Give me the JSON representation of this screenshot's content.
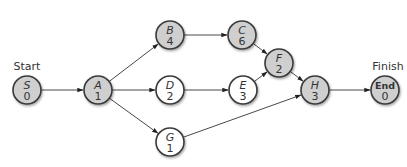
{
  "diagram": {
    "type": "activity-on-node network",
    "labels": {
      "start": "Start",
      "finish": "Finish"
    },
    "colors": {
      "critical_fill": "#cfcfcf",
      "normal_fill": "#ffffff",
      "stroke": "#3a3a3a"
    },
    "nodes": [
      {
        "id": "S",
        "name": "S",
        "duration": "0",
        "x": 27,
        "y": 90,
        "critical": true
      },
      {
        "id": "A",
        "name": "A",
        "duration": "1",
        "x": 98,
        "y": 90,
        "critical": true
      },
      {
        "id": "B",
        "name": "B",
        "duration": "4",
        "x": 170,
        "y": 35,
        "critical": true
      },
      {
        "id": "C",
        "name": "C",
        "duration": "6",
        "x": 242,
        "y": 35,
        "critical": true
      },
      {
        "id": "D",
        "name": "D",
        "duration": "2",
        "x": 170,
        "y": 90,
        "critical": false
      },
      {
        "id": "E",
        "name": "E",
        "duration": "3",
        "x": 243,
        "y": 90,
        "critical": false
      },
      {
        "id": "F",
        "name": "F",
        "duration": "2",
        "x": 279,
        "y": 63,
        "critical": true
      },
      {
        "id": "G",
        "name": "G",
        "duration": "1",
        "x": 170,
        "y": 142,
        "critical": false
      },
      {
        "id": "H",
        "name": "H",
        "duration": "3",
        "x": 315,
        "y": 90,
        "critical": true
      },
      {
        "id": "End",
        "name": "End",
        "duration": "0",
        "x": 385,
        "y": 90,
        "critical": true
      }
    ],
    "edges": [
      [
        "S",
        "A"
      ],
      [
        "A",
        "B"
      ],
      [
        "A",
        "D"
      ],
      [
        "A",
        "G"
      ],
      [
        "B",
        "C"
      ],
      [
        "C",
        "F"
      ],
      [
        "D",
        "E"
      ],
      [
        "E",
        "F"
      ],
      [
        "F",
        "H"
      ],
      [
        "G",
        "H"
      ],
      [
        "H",
        "End"
      ]
    ]
  }
}
